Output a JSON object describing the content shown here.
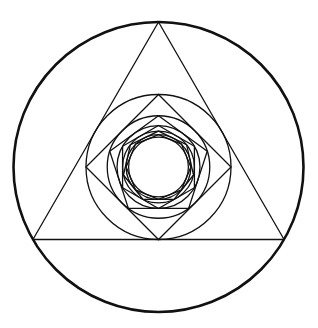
{
  "diagram": {
    "title": "Nested inscribed polygons and circles",
    "center": [
      158.5,
      167
    ],
    "outer_radius": 145,
    "stroke_color": "#111111",
    "background_color": "#ffffff",
    "outer_stroke_width": 2.6,
    "inner_stroke_width": 1.3,
    "polygon_sides": [
      3,
      4,
      5,
      6,
      7,
      8
    ],
    "elements": [
      {
        "type": "circle",
        "name": "outer-circle"
      },
      {
        "type": "polygon",
        "sides": 3,
        "name": "triangle"
      },
      {
        "type": "circle",
        "name": "circle-in-triangle"
      },
      {
        "type": "polygon",
        "sides": 4,
        "name": "square"
      },
      {
        "type": "circle",
        "name": "circle-in-square"
      },
      {
        "type": "polygon",
        "sides": 5,
        "name": "pentagon"
      },
      {
        "type": "circle",
        "name": "circle-in-pentagon"
      },
      {
        "type": "polygon",
        "sides": 6,
        "name": "hexagon"
      },
      {
        "type": "circle",
        "name": "circle-in-hexagon"
      },
      {
        "type": "polygon",
        "sides": 7,
        "name": "heptagon"
      },
      {
        "type": "circle",
        "name": "circle-in-heptagon"
      },
      {
        "type": "polygon",
        "sides": 8,
        "name": "octagon"
      },
      {
        "type": "circle",
        "name": "innermost-circle"
      }
    ]
  }
}
